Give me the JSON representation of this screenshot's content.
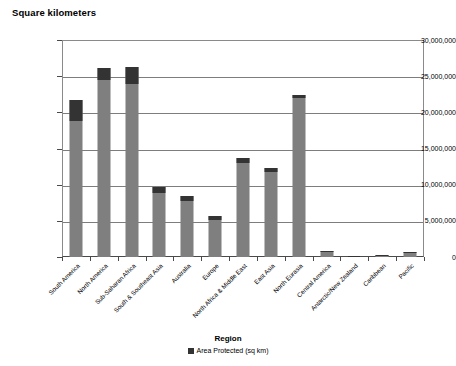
{
  "chart_data": {
    "type": "bar",
    "title": "",
    "ylabel": "Square kilometers",
    "xlabel": "Region",
    "ylim": [
      0,
      30000000
    ],
    "ytick_labels": [
      "30,000,000",
      "25,000,000",
      "20,000,000",
      "15,000,000",
      "10,000,000",
      "5,000,000",
      "0"
    ],
    "ytick_values": [
      30000000,
      25000000,
      20000000,
      15000000,
      10000000,
      5000000,
      0
    ],
    "grid": true,
    "legend_position": "bottom",
    "legend": [
      "Area Protected (sq km)"
    ],
    "categories": [
      "South America",
      "North America",
      "Sub-Saharan Africa",
      "South & Southeast Asia",
      "Australia",
      "Europe",
      "North Africa & Middle East",
      "East Asia",
      "North Eurasia",
      "Central America",
      "Antarctic/New Zealand",
      "Caribbean",
      "Pacific"
    ],
    "series": [
      {
        "name": "Total Area (sq km)",
        "values": [
          21700000,
          26200000,
          26300000,
          9700000,
          8400000,
          5700000,
          13700000,
          12300000,
          22400000,
          900000,
          150000,
          300000,
          700000
        ]
      },
      {
        "name": "Area Protected (sq km)",
        "values": [
          3000000,
          1700000,
          2400000,
          800000,
          700000,
          600000,
          700000,
          500000,
          400000,
          200000,
          80000,
          100000,
          200000
        ]
      }
    ],
    "bar_segments": [
      {
        "category": "South America",
        "gray_top": 18800000,
        "total": 21700000
      },
      {
        "category": "North America",
        "gray_top": 24500000,
        "total": 26200000
      },
      {
        "category": "Sub-Saharan Africa",
        "gray_top": 23900000,
        "total": 26300000
      },
      {
        "category": "South & Southeast Asia",
        "gray_top": 8900000,
        "total": 9700000
      },
      {
        "category": "Australia",
        "gray_top": 7700000,
        "total": 8400000
      },
      {
        "category": "Europe",
        "gray_top": 5100000,
        "total": 5700000
      },
      {
        "category": "North Africa & Middle East",
        "gray_top": 13000000,
        "total": 13700000
      },
      {
        "category": "East Asia",
        "gray_top": 11800000,
        "total": 12300000
      },
      {
        "category": "North Eurasia",
        "gray_top": 22000000,
        "total": 22400000
      },
      {
        "category": "Central America",
        "gray_top": 700000,
        "total": 900000
      },
      {
        "category": "Antarctic/New Zealand",
        "gray_top": 70000,
        "total": 150000
      },
      {
        "category": "Caribbean",
        "gray_top": 200000,
        "total": 300000
      },
      {
        "category": "Pacific",
        "gray_top": 500000,
        "total": 700000
      }
    ],
    "colors": {
      "bar_gray": "#7f7f7f",
      "bar_dark": "#333333",
      "gridline": "#7d7d7d",
      "axis": "#4a4a4a",
      "text": "#000000"
    }
  }
}
